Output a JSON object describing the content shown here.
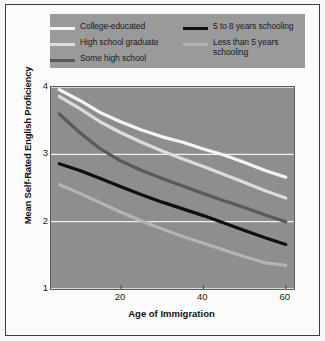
{
  "figure": {
    "background_color": "#f6f6f4",
    "frame_color": "#3c3c3c",
    "plot_background_color": "#8e8e8e",
    "legend_background_color": "#9a9a9a",
    "gridline_color": "#f0f0ee"
  },
  "legend": {
    "columns": [
      {
        "entries": [
          {
            "label": "College-educated",
            "color": "#f4f4f2",
            "swatch_name": "legend-swatch-college-educated"
          },
          {
            "label": "High school graduate",
            "color": "#dcdcda",
            "swatch_name": "legend-swatch-high-school-graduate"
          },
          {
            "label": "Some high school",
            "color": "#5a5a5a",
            "swatch_name": "legend-swatch-some-high-school"
          }
        ]
      },
      {
        "entries": [
          {
            "label": "5 to 8 years schooling",
            "color": "#101010",
            "swatch_name": "legend-swatch-5-to-8-years"
          },
          {
            "label": "Less than 5 years\nschooling",
            "color": "#b4b4b2",
            "swatch_name": "legend-swatch-less-than-5-years"
          }
        ]
      }
    ]
  },
  "chart_data": {
    "type": "line",
    "title": "",
    "xlabel": "Age of Immigration",
    "ylabel": "Mean Self-Rated English Proficiency",
    "xlim": [
      3,
      62
    ],
    "ylim": [
      1,
      4
    ],
    "xticks": [
      20,
      40,
      60
    ],
    "yticks": [
      1,
      2,
      3,
      4
    ],
    "grid": "horizontal",
    "legend_position": "top",
    "x": [
      5,
      10,
      15,
      20,
      25,
      30,
      35,
      40,
      45,
      50,
      55,
      60
    ],
    "series": [
      {
        "name": "College-educated",
        "color": "#f4f4f2",
        "values": [
          3.96,
          3.8,
          3.62,
          3.48,
          3.36,
          3.26,
          3.18,
          3.08,
          2.99,
          2.88,
          2.76,
          2.66
        ]
      },
      {
        "name": "High school graduate",
        "color": "#dcdcda",
        "values": [
          3.86,
          3.68,
          3.48,
          3.32,
          3.18,
          3.05,
          2.93,
          2.82,
          2.7,
          2.58,
          2.46,
          2.35
        ]
      },
      {
        "name": "Some high school",
        "color": "#5a5a5a",
        "values": [
          3.6,
          3.32,
          3.08,
          2.9,
          2.76,
          2.64,
          2.53,
          2.42,
          2.31,
          2.21,
          2.1,
          2.0
        ]
      },
      {
        "name": "5 to 8 years schooling",
        "color": "#101010",
        "values": [
          2.86,
          2.76,
          2.64,
          2.52,
          2.4,
          2.29,
          2.19,
          2.09,
          1.98,
          1.87,
          1.76,
          1.66
        ]
      },
      {
        "name": "Less than 5 years schooling",
        "color": "#b4b4b2",
        "values": [
          2.55,
          2.42,
          2.28,
          2.14,
          2.01,
          1.89,
          1.78,
          1.68,
          1.58,
          1.48,
          1.39,
          1.35
        ]
      }
    ]
  }
}
